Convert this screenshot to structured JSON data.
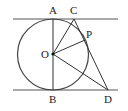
{
  "points": {
    "A": {
      "label": "A",
      "x": 53,
      "y": 19
    },
    "B": {
      "label": "B",
      "x": 53,
      "y": 90
    },
    "C": {
      "label": "C",
      "x": 74,
      "y": 19
    },
    "D": {
      "label": "D",
      "x": 108,
      "y": 90
    },
    "O": {
      "label": "O",
      "x": 53,
      "y": 54
    },
    "P": {
      "label": "P",
      "x": 85,
      "y": 40
    }
  },
  "circle": {
    "center": "O",
    "radius": 35
  },
  "lines": {
    "top": {
      "x1": 13,
      "y1": 19,
      "x2": 118,
      "y2": 19
    },
    "bottom": {
      "x1": 13,
      "y1": 90,
      "x2": 118,
      "y2": 90
    }
  },
  "segments": [
    "AB",
    "OC",
    "OP",
    "OD",
    "CD"
  ],
  "colors": {
    "stroke": "#333333",
    "background": "#ffffff"
  }
}
